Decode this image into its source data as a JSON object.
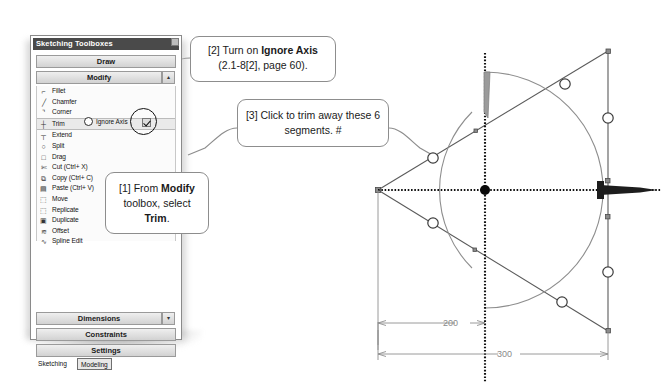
{
  "panel": {
    "title": "Sketching Toolboxes",
    "close_glyph": "",
    "sections": {
      "draw": "Draw",
      "modify": "Modify",
      "modify_arrow": "▴",
      "dimensions": "Dimensions",
      "dimensions_arrow": "▾",
      "constraints": "Constraints",
      "settings": "Settings"
    },
    "tools": [
      {
        "label": "Fillet",
        "glyph": "⌐"
      },
      {
        "label": "Chamfer",
        "glyph": "╱"
      },
      {
        "label": "Corner",
        "glyph": "⌝"
      },
      {
        "label": "Trim",
        "glyph": "┼"
      },
      {
        "label": "Extend",
        "glyph": "┬"
      },
      {
        "label": "Split",
        "glyph": "○"
      },
      {
        "label": "Drag",
        "glyph": "□"
      },
      {
        "label": "Cut (Ctrl+ X)",
        "glyph": "✄"
      },
      {
        "label": "Copy (Ctrl+ C)",
        "glyph": "⧉"
      },
      {
        "label": "Paste (Ctrl+ V)",
        "glyph": "▤"
      },
      {
        "label": "Move",
        "glyph": "⬚"
      },
      {
        "label": "Replicate",
        "glyph": "⬚"
      },
      {
        "label": "Duplicate",
        "glyph": "▣"
      },
      {
        "label": "Offset",
        "glyph": "≋"
      },
      {
        "label": "Spline Edit",
        "glyph": "∿"
      }
    ],
    "selected_tool": "Trim",
    "option": {
      "label": "Ignore Axis",
      "checked": true
    },
    "tabs": [
      {
        "label": "Sketching",
        "active": false
      },
      {
        "label": "Modeling",
        "active": true
      }
    ]
  },
  "callouts": {
    "one": {
      "prefix": "[1] From ",
      "bold1": "Modify",
      "mid": " toolbox, select ",
      "bold2": "Trim",
      "suffix": "."
    },
    "two": {
      "prefix": "[2] Turn on ",
      "bold1": "Ignore Axis",
      "suffix": " (2.1-8[2], page 60)."
    },
    "three": {
      "text": "[3] Click to trim away these 6 segments. #"
    }
  },
  "drawing": {
    "dimensions": [
      {
        "value": "200"
      },
      {
        "value": "300"
      }
    ],
    "colors": {
      "geometry": "#5a5a5a",
      "arc": "#8e8e8e",
      "axis": "#111111",
      "dimension": "#8e8e8e",
      "handle_fill": "#ffffff"
    }
  }
}
